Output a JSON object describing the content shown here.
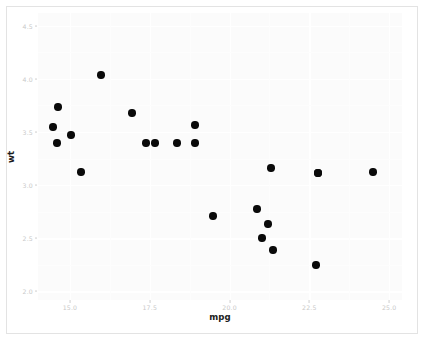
{
  "chart_data": {
    "type": "scatter",
    "title": "",
    "xlabel": "mpg",
    "ylabel": "wt",
    "xlim": [
      14.0,
      25.4
    ],
    "ylim": [
      1.92,
      4.62
    ],
    "xticks": [
      15.0,
      17.5,
      20.0,
      22.5,
      25.0
    ],
    "xticklabels": [
      "15.0",
      "17.5",
      "20.0",
      "22.5",
      "25.0"
    ],
    "yticks": [
      2.0,
      2.5,
      3.0,
      3.5,
      4.0,
      4.5
    ],
    "yticklabels": [
      "2.0",
      "2.5",
      "3.0",
      "3.5",
      "4.0",
      "4.5"
    ],
    "grid": true,
    "minor_grid": true,
    "legend": null,
    "point_color": "#0a0a0a",
    "point_size": 7.4,
    "panel_background": "#fbfbfb",
    "grid_color": "#ffffff",
    "figure_background": "#ffffff",
    "x": [
      15.2,
      14.7,
      15.5,
      15.0,
      15.8,
      16.4,
      17.3,
      17.8,
      18.1,
      18.7,
      19.2,
      19.2,
      19.7,
      21.0,
      21.0,
      21.4,
      21.4,
      21.5,
      22.8,
      22.8,
      23.0,
      24.4
    ],
    "y": [
      3.78,
      3.57,
      3.44,
      3.57,
      3.17,
      4.07,
      3.73,
      3.44,
      3.46,
      3.44,
      3.84,
      3.44,
      2.77,
      3.21,
      2.62,
      2.88,
      3.215,
      2.465,
      3.15,
      2.32,
      3.15,
      3.19
    ],
    "points": [
      {
        "px": 58,
        "py": 107,
        "mpg": 15.2,
        "wt": 3.78
      },
      {
        "px": 53,
        "py": 127,
        "mpg": 14.7,
        "wt": 3.57
      },
      {
        "px": 71,
        "py": 135,
        "mpg": 15.5,
        "wt": 3.44
      },
      {
        "px": 57,
        "py": 143,
        "mpg": 15.0,
        "wt": 3.57
      },
      {
        "px": 81,
        "py": 172,
        "mpg": 15.8,
        "wt": 3.17
      },
      {
        "px": 101,
        "py": 75,
        "mpg": 16.4,
        "wt": 4.07
      },
      {
        "px": 132,
        "py": 113,
        "mpg": 17.3,
        "wt": 3.73
      },
      {
        "px": 146,
        "py": 143,
        "mpg": 17.8,
        "wt": 3.44
      },
      {
        "px": 155,
        "py": 143,
        "mpg": 18.1,
        "wt": 3.46
      },
      {
        "px": 177,
        "py": 143,
        "mpg": 18.7,
        "wt": 3.44
      },
      {
        "px": 195,
        "py": 125,
        "mpg": 19.2,
        "wt": 3.84
      },
      {
        "px": 195,
        "py": 143,
        "mpg": 19.2,
        "wt": 3.44
      },
      {
        "px": 213,
        "py": 216,
        "mpg": 19.7,
        "wt": 2.77
      },
      {
        "px": 257,
        "py": 209,
        "mpg": 21.0,
        "wt": 3.21
      },
      {
        "px": 262,
        "py": 238,
        "mpg": 21.0,
        "wt": 2.62
      },
      {
        "px": 268,
        "py": 224,
        "mpg": 21.4,
        "wt": 2.88
      },
      {
        "px": 271,
        "py": 168,
        "mpg": 21.4,
        "wt": 3.215
      },
      {
        "px": 273,
        "py": 250,
        "mpg": 21.5,
        "wt": 2.465
      },
      {
        "px": 318,
        "py": 173,
        "mpg": 22.8,
        "wt": 3.15
      },
      {
        "px": 316,
        "py": 265,
        "mpg": 22.8,
        "wt": 2.32
      },
      {
        "px": 318,
        "py": 173,
        "mpg": 23.0,
        "wt": 3.15
      },
      {
        "px": 373,
        "py": 172,
        "mpg": 24.4,
        "wt": 3.19
      }
    ]
  }
}
